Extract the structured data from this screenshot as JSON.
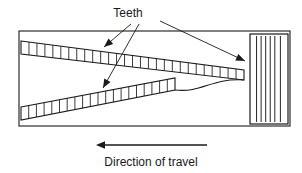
{
  "figure": {
    "kind": "technical-line-diagram",
    "background_color": "#ffffff",
    "line_color": "#1a1a1a"
  },
  "labels": {
    "teeth_label": "Teeth",
    "teeth_label_x": 128,
    "teeth_label_y": 17,
    "direction_caption": "Direction of travel",
    "direction_caption_x": 151,
    "direction_caption_y": 166
  },
  "frame": {
    "name": "outer-rectangle",
    "x": 19,
    "y": 31,
    "width": 271,
    "height": 95
  },
  "travel_arrow": {
    "name": "direction-of-travel-arrow",
    "tail_x": 207,
    "tip_x": 96,
    "y": 145,
    "points_toward": "left"
  },
  "leaders": [
    {
      "name": "leader-to-upper-band",
      "from_x": 131,
      "from_y": 24,
      "to_x": 104,
      "to_y": 47
    },
    {
      "name": "leader-to-lower-band",
      "from_x": 139,
      "from_y": 24,
      "to_x": 103,
      "to_y": 88
    },
    {
      "name": "leader-to-ribbed-block",
      "from_x": 160,
      "from_y": 21,
      "to_x": 245,
      "to_y": 61
    }
  ],
  "upper_band": {
    "name": "upper-toothed-band",
    "left_top_x": 21,
    "left_top_y": 41,
    "left_bottom_y": 54,
    "right_x": 244,
    "right_top_y": 70,
    "right_bottom_y": 80,
    "tooth_count": 28
  },
  "lower_band": {
    "name": "lower-toothed-band",
    "left_x": 21,
    "left_top_y": 107,
    "left_bottom_y": 120,
    "right_x": 175,
    "right_top_y": 78,
    "right_bottom_y": 90,
    "tooth_count": 20
  },
  "ribbed_block": {
    "name": "ribbed-block",
    "x": 250,
    "y": 34,
    "width": 38,
    "height": 90,
    "rib_count": 5
  }
}
